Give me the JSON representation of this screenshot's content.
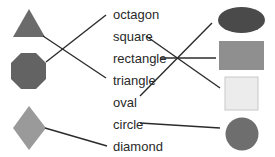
{
  "diagram": {
    "type": "shape-name matching exercise",
    "labels": [
      "octagon",
      "square",
      "rectangle",
      "triangle",
      "oval",
      "circle",
      "diamond"
    ],
    "left_shapes": [
      {
        "shape": "triangle",
        "color": "#6b6b6b"
      },
      {
        "shape": "octagon",
        "color": "#636363"
      },
      {
        "shape": "diamond",
        "color": "#9a9a9a"
      }
    ],
    "right_shapes": [
      {
        "shape": "oval",
        "color": "#4a4a4a"
      },
      {
        "shape": "rectangle",
        "color": "#8f8f8f"
      },
      {
        "shape": "square",
        "color": "#ececec"
      },
      {
        "shape": "circle",
        "color": "#6e6e6e"
      }
    ],
    "connections": [
      {
        "from": "triangle-shape",
        "to": "triangle"
      },
      {
        "from": "octagon-shape",
        "to": "octagon"
      },
      {
        "from": "diamond-shape",
        "to": "diamond"
      },
      {
        "from": "square",
        "to": "square-shape"
      },
      {
        "from": "rectangle",
        "to": "rectangle-shape"
      },
      {
        "from": "oval",
        "to": "oval-shape"
      },
      {
        "from": "circle",
        "to": "circle-shape"
      }
    ],
    "line_color": "#2b2b2b"
  }
}
